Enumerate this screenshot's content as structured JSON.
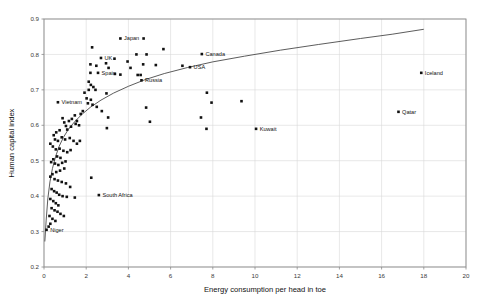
{
  "chart_data": {
    "type": "scatter",
    "title": "",
    "xlabel": "Energy consumption per head in toe",
    "ylabel": "Human capital index",
    "xlim": [
      0,
      20
    ],
    "ylim": [
      0.2,
      0.9
    ],
    "xticks": [
      0,
      2,
      4,
      6,
      8,
      10,
      12,
      14,
      16,
      18,
      20
    ],
    "xtick_labels": [
      "0",
      "2",
      "4",
      "6",
      "8",
      "10",
      "12",
      "14",
      "16",
      "18",
      "20"
    ],
    "yticks": [
      0.2,
      0.3,
      0.4,
      0.5,
      0.6,
      0.7,
      0.8,
      0.9
    ],
    "ytick_labels": [
      "0.2",
      "0.3",
      "0.4",
      "0.5",
      "0.6",
      "0.7",
      "0.8",
      "0.9"
    ],
    "grid": true,
    "grid_axis": "both",
    "legend": false,
    "marker": "square",
    "marker_color": "#111111",
    "series": [
      {
        "name": "Countries",
        "points": [
          {
            "x": 3.62,
            "y": 0.845,
            "label": "Japan",
            "label_pos": "right"
          },
          {
            "x": 7.48,
            "y": 0.801,
            "label": "Canada",
            "label_pos": "right"
          },
          {
            "x": 6.92,
            "y": 0.764,
            "label": "USA",
            "label_pos": "right"
          },
          {
            "x": 2.7,
            "y": 0.79,
            "label": "UK",
            "label_pos": "right"
          },
          {
            "x": 2.56,
            "y": 0.748,
            "label": "Spain",
            "label_pos": "right"
          },
          {
            "x": 4.62,
            "y": 0.727,
            "label": "Russia",
            "label_pos": "right"
          },
          {
            "x": 0.66,
            "y": 0.665,
            "label": "Vietnam",
            "label_pos": "right"
          },
          {
            "x": 17.88,
            "y": 0.748,
            "label": "Iceland",
            "label_pos": "right"
          },
          {
            "x": 16.8,
            "y": 0.638,
            "label": "Qatar",
            "label_pos": "right"
          },
          {
            "x": 10.05,
            "y": 0.59,
            "label": "Kuwait",
            "label_pos": "right"
          },
          {
            "x": 2.6,
            "y": 0.403,
            "label": "South Africa",
            "label_pos": "right"
          },
          {
            "x": 0.12,
            "y": 0.305,
            "label": "Niger",
            "label_pos": "right"
          },
          {
            "x": 2.28,
            "y": 0.82,
            "label": "",
            "label_pos": "right"
          },
          {
            "x": 4.72,
            "y": 0.845,
            "label": "",
            "label_pos": "right"
          },
          {
            "x": 5.66,
            "y": 0.815,
            "label": "",
            "label_pos": "right"
          },
          {
            "x": 4.38,
            "y": 0.8,
            "label": "",
            "label_pos": "right"
          },
          {
            "x": 4.86,
            "y": 0.8,
            "label": "",
            "label_pos": "right"
          },
          {
            "x": 3.34,
            "y": 0.788,
            "label": "",
            "label_pos": "right"
          },
          {
            "x": 3.96,
            "y": 0.78,
            "label": "",
            "label_pos": "right"
          },
          {
            "x": 2.2,
            "y": 0.772,
            "label": "",
            "label_pos": "right"
          },
          {
            "x": 2.94,
            "y": 0.775,
            "label": "",
            "label_pos": "right"
          },
          {
            "x": 2.48,
            "y": 0.768,
            "label": "",
            "label_pos": "right"
          },
          {
            "x": 3.06,
            "y": 0.762,
            "label": "",
            "label_pos": "right"
          },
          {
            "x": 4.1,
            "y": 0.762,
            "label": "",
            "label_pos": "right"
          },
          {
            "x": 4.7,
            "y": 0.772,
            "label": "",
            "label_pos": "right"
          },
          {
            "x": 5.3,
            "y": 0.77,
            "label": "",
            "label_pos": "right"
          },
          {
            "x": 2.2,
            "y": 0.748,
            "label": "",
            "label_pos": "right"
          },
          {
            "x": 3.36,
            "y": 0.745,
            "label": "",
            "label_pos": "right"
          },
          {
            "x": 3.62,
            "y": 0.743,
            "label": "",
            "label_pos": "right"
          },
          {
            "x": 4.44,
            "y": 0.742,
            "label": "",
            "label_pos": "right"
          },
          {
            "x": 4.58,
            "y": 0.742,
            "label": "",
            "label_pos": "right"
          },
          {
            "x": 6.56,
            "y": 0.768,
            "label": "",
            "label_pos": "right"
          },
          {
            "x": 2.12,
            "y": 0.723,
            "label": "",
            "label_pos": "right"
          },
          {
            "x": 2.22,
            "y": 0.714,
            "label": "",
            "label_pos": "right"
          },
          {
            "x": 2.34,
            "y": 0.708,
            "label": "",
            "label_pos": "right"
          },
          {
            "x": 2.12,
            "y": 0.7,
            "label": "",
            "label_pos": "right"
          },
          {
            "x": 2.44,
            "y": 0.7,
            "label": "",
            "label_pos": "right"
          },
          {
            "x": 1.92,
            "y": 0.692,
            "label": "",
            "label_pos": "right"
          },
          {
            "x": 2.96,
            "y": 0.69,
            "label": "",
            "label_pos": "right"
          },
          {
            "x": 7.72,
            "y": 0.692,
            "label": "",
            "label_pos": "right"
          },
          {
            "x": 7.94,
            "y": 0.664,
            "label": "",
            "label_pos": "right"
          },
          {
            "x": 9.36,
            "y": 0.668,
            "label": "",
            "label_pos": "right"
          },
          {
            "x": 2.02,
            "y": 0.676,
            "label": "",
            "label_pos": "right"
          },
          {
            "x": 2.22,
            "y": 0.672,
            "label": "",
            "label_pos": "right"
          },
          {
            "x": 2.08,
            "y": 0.662,
            "label": "",
            "label_pos": "right"
          },
          {
            "x": 2.3,
            "y": 0.658,
            "label": "",
            "label_pos": "right"
          },
          {
            "x": 2.5,
            "y": 0.652,
            "label": "",
            "label_pos": "right"
          },
          {
            "x": 2.74,
            "y": 0.64,
            "label": "",
            "label_pos": "right"
          },
          {
            "x": 3.04,
            "y": 0.622,
            "label": "",
            "label_pos": "right"
          },
          {
            "x": 2.98,
            "y": 0.592,
            "label": "",
            "label_pos": "right"
          },
          {
            "x": 7.44,
            "y": 0.622,
            "label": "",
            "label_pos": "right"
          },
          {
            "x": 7.7,
            "y": 0.59,
            "label": "",
            "label_pos": "right"
          },
          {
            "x": 4.84,
            "y": 0.65,
            "label": "",
            "label_pos": "right"
          },
          {
            "x": 5.02,
            "y": 0.61,
            "label": "",
            "label_pos": "right"
          },
          {
            "x": 0.88,
            "y": 0.62,
            "label": "",
            "label_pos": "right"
          },
          {
            "x": 0.96,
            "y": 0.608,
            "label": "",
            "label_pos": "right"
          },
          {
            "x": 1.04,
            "y": 0.598,
            "label": "",
            "label_pos": "right"
          },
          {
            "x": 1.18,
            "y": 0.612,
            "label": "",
            "label_pos": "right"
          },
          {
            "x": 1.32,
            "y": 0.618,
            "label": "",
            "label_pos": "right"
          },
          {
            "x": 1.46,
            "y": 0.628,
            "label": "",
            "label_pos": "right"
          },
          {
            "x": 1.56,
            "y": 0.612,
            "label": "",
            "label_pos": "right"
          },
          {
            "x": 1.66,
            "y": 0.6,
            "label": "",
            "label_pos": "right"
          },
          {
            "x": 1.74,
            "y": 0.632,
            "label": "",
            "label_pos": "right"
          },
          {
            "x": 1.84,
            "y": 0.64,
            "label": "",
            "label_pos": "right"
          },
          {
            "x": 1.5,
            "y": 0.604,
            "label": "",
            "label_pos": "right"
          },
          {
            "x": 1.28,
            "y": 0.596,
            "label": "",
            "label_pos": "right"
          },
          {
            "x": 1.1,
            "y": 0.588,
            "label": "",
            "label_pos": "right"
          },
          {
            "x": 0.74,
            "y": 0.586,
            "label": "",
            "label_pos": "right"
          },
          {
            "x": 0.58,
            "y": 0.58,
            "label": "",
            "label_pos": "right"
          },
          {
            "x": 0.46,
            "y": 0.572,
            "label": "",
            "label_pos": "right"
          },
          {
            "x": 0.52,
            "y": 0.56,
            "label": "",
            "label_pos": "right"
          },
          {
            "x": 0.66,
            "y": 0.556,
            "label": "",
            "label_pos": "right"
          },
          {
            "x": 0.84,
            "y": 0.566,
            "label": "",
            "label_pos": "right"
          },
          {
            "x": 1.0,
            "y": 0.56,
            "label": "",
            "label_pos": "right"
          },
          {
            "x": 1.22,
            "y": 0.564,
            "label": "",
            "label_pos": "right"
          },
          {
            "x": 1.4,
            "y": 0.556,
            "label": "",
            "label_pos": "right"
          },
          {
            "x": 1.56,
            "y": 0.548,
            "label": "",
            "label_pos": "right"
          },
          {
            "x": 1.7,
            "y": 0.556,
            "label": "",
            "label_pos": "right"
          },
          {
            "x": 0.3,
            "y": 0.548,
            "label": "",
            "label_pos": "right"
          },
          {
            "x": 0.42,
            "y": 0.54,
            "label": "",
            "label_pos": "right"
          },
          {
            "x": 0.56,
            "y": 0.532,
            "label": "",
            "label_pos": "right"
          },
          {
            "x": 0.74,
            "y": 0.534,
            "label": "",
            "label_pos": "right"
          },
          {
            "x": 0.92,
            "y": 0.528,
            "label": "",
            "label_pos": "right"
          },
          {
            "x": 1.1,
            "y": 0.524,
            "label": "",
            "label_pos": "right"
          },
          {
            "x": 1.26,
            "y": 0.53,
            "label": "",
            "label_pos": "right"
          },
          {
            "x": 0.62,
            "y": 0.512,
            "label": "",
            "label_pos": "right"
          },
          {
            "x": 0.78,
            "y": 0.508,
            "label": "",
            "label_pos": "right"
          },
          {
            "x": 0.44,
            "y": 0.504,
            "label": "",
            "label_pos": "right"
          },
          {
            "x": 0.34,
            "y": 0.496,
            "label": "",
            "label_pos": "right"
          },
          {
            "x": 0.52,
            "y": 0.492,
            "label": "",
            "label_pos": "right"
          },
          {
            "x": 0.68,
            "y": 0.488,
            "label": "",
            "label_pos": "right"
          },
          {
            "x": 0.86,
            "y": 0.494,
            "label": "",
            "label_pos": "right"
          },
          {
            "x": 1.02,
            "y": 0.498,
            "label": "",
            "label_pos": "right"
          },
          {
            "x": 0.96,
            "y": 0.478,
            "label": "",
            "label_pos": "right"
          },
          {
            "x": 0.76,
            "y": 0.472,
            "label": "",
            "label_pos": "right"
          },
          {
            "x": 0.58,
            "y": 0.468,
            "label": "",
            "label_pos": "right"
          },
          {
            "x": 0.4,
            "y": 0.462,
            "label": "",
            "label_pos": "right"
          },
          {
            "x": 0.3,
            "y": 0.455,
            "label": "",
            "label_pos": "right"
          },
          {
            "x": 0.5,
            "y": 0.448,
            "label": "",
            "label_pos": "right"
          },
          {
            "x": 0.66,
            "y": 0.444,
            "label": "",
            "label_pos": "right"
          },
          {
            "x": 0.84,
            "y": 0.44,
            "label": "",
            "label_pos": "right"
          },
          {
            "x": 1.04,
            "y": 0.436,
            "label": "",
            "label_pos": "right"
          },
          {
            "x": 1.24,
            "y": 0.426,
            "label": "",
            "label_pos": "right"
          },
          {
            "x": 2.24,
            "y": 0.452,
            "label": "",
            "label_pos": "right"
          },
          {
            "x": 0.36,
            "y": 0.42,
            "label": "",
            "label_pos": "right"
          },
          {
            "x": 0.48,
            "y": 0.414,
            "label": "",
            "label_pos": "right"
          },
          {
            "x": 0.6,
            "y": 0.41,
            "label": "",
            "label_pos": "right"
          },
          {
            "x": 0.72,
            "y": 0.404,
            "label": "",
            "label_pos": "right"
          },
          {
            "x": 0.88,
            "y": 0.4,
            "label": "",
            "label_pos": "right"
          },
          {
            "x": 1.08,
            "y": 0.398,
            "label": "",
            "label_pos": "right"
          },
          {
            "x": 1.46,
            "y": 0.396,
            "label": "",
            "label_pos": "right"
          },
          {
            "x": 0.3,
            "y": 0.392,
            "label": "",
            "label_pos": "right"
          },
          {
            "x": 0.44,
            "y": 0.386,
            "label": "",
            "label_pos": "right"
          },
          {
            "x": 0.56,
            "y": 0.38,
            "label": "",
            "label_pos": "right"
          },
          {
            "x": 0.68,
            "y": 0.374,
            "label": "",
            "label_pos": "right"
          },
          {
            "x": 0.36,
            "y": 0.366,
            "label": "",
            "label_pos": "right"
          },
          {
            "x": 0.5,
            "y": 0.36,
            "label": "",
            "label_pos": "right"
          },
          {
            "x": 0.64,
            "y": 0.356,
            "label": "",
            "label_pos": "right"
          },
          {
            "x": 0.78,
            "y": 0.35,
            "label": "",
            "label_pos": "right"
          },
          {
            "x": 0.94,
            "y": 0.344,
            "label": "",
            "label_pos": "right"
          },
          {
            "x": 0.26,
            "y": 0.344,
            "label": "",
            "label_pos": "right"
          },
          {
            "x": 0.4,
            "y": 0.336,
            "label": "",
            "label_pos": "right"
          },
          {
            "x": 0.54,
            "y": 0.33,
            "label": "",
            "label_pos": "right"
          },
          {
            "x": 0.3,
            "y": 0.322,
            "label": "",
            "label_pos": "right"
          },
          {
            "x": 0.22,
            "y": 0.314,
            "label": "",
            "label_pos": "right"
          }
        ]
      }
    ],
    "trend": {
      "name": "logarithmic-fit",
      "color": "#4a4a4a",
      "x_start": 0.04,
      "x_end": 18.0,
      "points": [
        {
          "x": 0.04,
          "y": 0.272
        },
        {
          "x": 0.1,
          "y": 0.33
        },
        {
          "x": 0.18,
          "y": 0.392
        },
        {
          "x": 0.28,
          "y": 0.44
        },
        {
          "x": 0.4,
          "y": 0.478
        },
        {
          "x": 0.55,
          "y": 0.512
        },
        {
          "x": 0.72,
          "y": 0.541
        },
        {
          "x": 0.92,
          "y": 0.566
        },
        {
          "x": 1.15,
          "y": 0.588
        },
        {
          "x": 1.45,
          "y": 0.61
        },
        {
          "x": 1.8,
          "y": 0.631
        },
        {
          "x": 2.2,
          "y": 0.651
        },
        {
          "x": 2.7,
          "y": 0.671
        },
        {
          "x": 3.3,
          "y": 0.691
        },
        {
          "x": 4.0,
          "y": 0.71
        },
        {
          "x": 4.8,
          "y": 0.729
        },
        {
          "x": 5.7,
          "y": 0.746
        },
        {
          "x": 6.8,
          "y": 0.763
        },
        {
          "x": 8.0,
          "y": 0.779
        },
        {
          "x": 9.5,
          "y": 0.795
        },
        {
          "x": 11.2,
          "y": 0.812
        },
        {
          "x": 13.0,
          "y": 0.828
        },
        {
          "x": 15.0,
          "y": 0.845
        },
        {
          "x": 16.5,
          "y": 0.857
        },
        {
          "x": 18.0,
          "y": 0.871
        }
      ]
    }
  }
}
